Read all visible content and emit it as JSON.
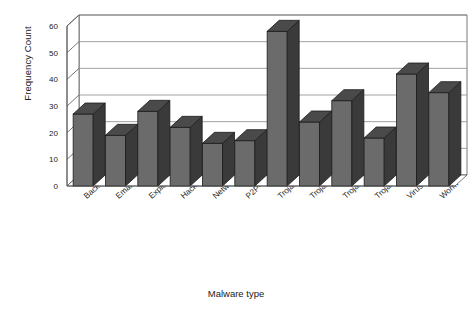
{
  "chart_data": {
    "type": "bar",
    "title": "",
    "subtitle": "",
    "xlabel": "Malware type",
    "ylabel": "Frequency Count",
    "categories": [
      "Backdoor",
      "Email-Worm",
      "Exploit",
      "Hacktool",
      "Network-Worm",
      "P2P-Worm",
      "Trojan",
      "Trojan-Downloader",
      "Trojan-Dropper",
      "Trojan-Spy",
      "Virus",
      "Worm"
    ],
    "values": [
      27,
      19,
      28,
      22,
      16,
      17,
      58,
      24,
      32,
      18,
      42,
      35
    ],
    "ylim": [
      0,
      60
    ],
    "yticks": [
      0,
      10,
      20,
      30,
      40,
      50,
      60
    ],
    "ytick_labels": [
      "0",
      "10",
      "20",
      "30",
      "40",
      "50",
      "60"
    ],
    "grid": true,
    "legend": false,
    "legend_position": "none",
    "style": "3d-columns",
    "bar_color": "#6b6b6b",
    "bar_side_color": "#3a3a3a",
    "bar_top_color": "#4a4a4a",
    "bar_outline_color": "#1c1c1c",
    "grid_color": "#8a8a8a",
    "axis_color": "#555555",
    "plot_background": "#ffffff",
    "page_background": "#ffffff"
  }
}
